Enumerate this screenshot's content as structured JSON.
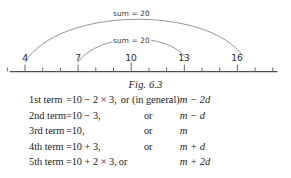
{
  "figure": {
    "caption": "Fig. 6.3",
    "arcs": [
      {
        "label": "sum = 20",
        "from": 4,
        "to": 16
      },
      {
        "label": "sum = 20",
        "from": 7,
        "to": 13
      }
    ],
    "number_line": {
      "labeled_ticks": [
        "4",
        "7",
        "10",
        "13",
        "16"
      ],
      "tick_min": 2,
      "tick_max": 17,
      "labeled_values": [
        4,
        7,
        10,
        13,
        16
      ]
    }
  },
  "equations": {
    "rows": [
      {
        "term": "1st term",
        "eq": "=",
        "value": "10 − 2 × 3,",
        "or": "or (in general)",
        "general": "m − 2d"
      },
      {
        "term": "2nd term",
        "eq": "=",
        "value": "10 − 3,",
        "or": "or",
        "general": "m −  d"
      },
      {
        "term": "3rd term",
        "eq": "=",
        "value": "10,",
        "or": "or",
        "general": "m"
      },
      {
        "term": "4th term",
        "eq": "=",
        "value": "10 + 3,",
        "or": "or",
        "general": "m +  d"
      },
      {
        "term": "5th term",
        "eq": "=",
        "value": "10 + 2 × 3,",
        "or": "or",
        "general": "m + 2d"
      }
    ]
  },
  "colors": {
    "background": "#ffffff",
    "ink": "#1a1a1a",
    "line": "#4a4a4a",
    "arc": "#7a7a7a"
  }
}
